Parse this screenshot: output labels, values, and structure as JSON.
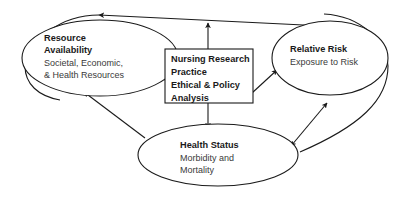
{
  "diagram": {
    "nodes": {
      "resource_availability": {
        "shape": "ellipse",
        "title": "Resource",
        "title2": "Availability",
        "sub1": "Societal, Economic,",
        "sub2": "& Health Resources"
      },
      "relative_risk": {
        "shape": "ellipse",
        "title": "Relative Risk",
        "sub1": "Exposure to Risk"
      },
      "health_status": {
        "shape": "ellipse",
        "title": "Health Status",
        "sub1": "Morbidity and",
        "sub2": "Mortality"
      },
      "nursing_box": {
        "shape": "rectangle",
        "line1": "Nursing Research",
        "line2": "Practice",
        "line3": "Ethical & Policy",
        "line4": "Analysis"
      }
    },
    "connectors": [
      {
        "name": "resource-risk-bidirectional",
        "from": "resource_availability",
        "to": "relative_risk",
        "arrowheads": "both"
      },
      {
        "name": "risk-health-bidirectional",
        "from": "relative_risk",
        "to": "health_status",
        "arrowheads": "both"
      },
      {
        "name": "health-to-resource",
        "from": "health_status",
        "to": "resource_availability",
        "arrowheads": "single"
      },
      {
        "name": "box-to-resource",
        "from": "nursing_box",
        "to": "resource_availability",
        "arrowheads": "single"
      },
      {
        "name": "box-to-risk",
        "from": "nursing_box",
        "to": "relative_risk",
        "arrowheads": "single"
      },
      {
        "name": "box-to-health",
        "from": "nursing_box",
        "to": "health_status",
        "arrowheads": "single"
      },
      {
        "name": "box-to-top-link",
        "from": "nursing_box",
        "to": "resource-risk-bidirectional",
        "arrowheads": "single"
      }
    ],
    "colors": {
      "stroke": "#1a1a1a",
      "fill": "#ffffff",
      "title_text": "#1a1a1a",
      "sub_text": "#3a3a3a"
    }
  }
}
